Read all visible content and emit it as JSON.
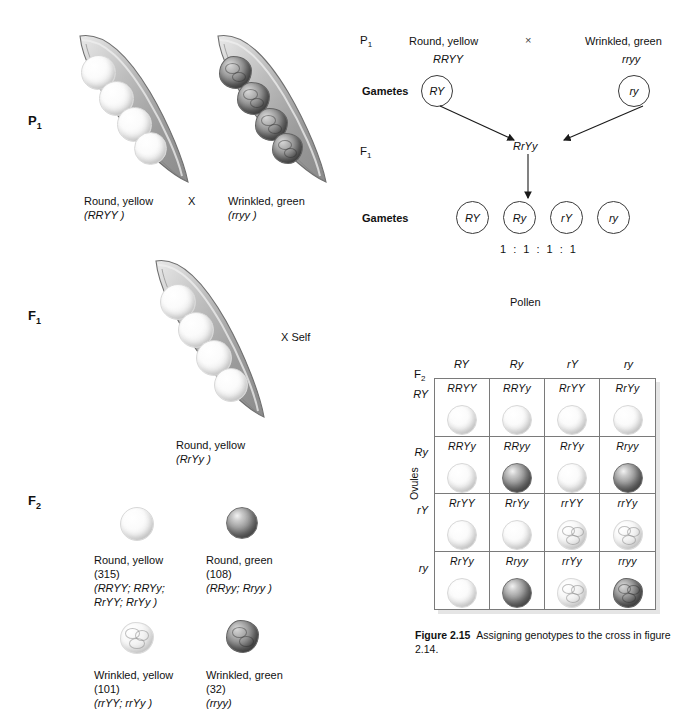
{
  "figure": {
    "number": "Figure 2.15",
    "caption": "Assigning genotypes to the cross in figure 2.14."
  },
  "left_panel": {
    "stages": {
      "p1": "P",
      "p1_sub": "1",
      "f1": "F",
      "f1_sub": "1",
      "f2": "F",
      "f2_sub": "2"
    },
    "p1": {
      "parent_left": {
        "phenotype": "Round, yellow",
        "genotype": "(RRYY )",
        "seed_type": "round-yellow"
      },
      "cross_symbol": "X",
      "parent_right": {
        "phenotype": "Wrinkled, green",
        "genotype": "(rryy )",
        "seed_type": "wrinkled-green"
      }
    },
    "f1": {
      "phenotype": "Round, yellow",
      "genotype": "(RrYy )",
      "self_label": "X Self"
    },
    "f2_classes": [
      {
        "seed_type": "round-yellow",
        "phenotype": "Round, yellow",
        "count": "(315)",
        "genotypes_line1": "(RRYY; RRYy;",
        "genotypes_line2": "RrYY; RrYy )"
      },
      {
        "seed_type": "round-green",
        "phenotype": "Round, green",
        "count": "(108)",
        "genotypes_line1": "(RRyy; Rryy )",
        "genotypes_line2": ""
      },
      {
        "seed_type": "wrinkled-yellow",
        "phenotype": "Wrinkled, yellow",
        "count": "(101)",
        "genotypes_line1": "(rrYY; rrYy )",
        "genotypes_line2": ""
      },
      {
        "seed_type": "wrinkled-green",
        "phenotype": "Wrinkled, green",
        "count": "(32)",
        "genotypes_line1": "(rryy)",
        "genotypes_line2": ""
      }
    ]
  },
  "right_panel": {
    "cross": {
      "p1_label": "P",
      "p1_sub": "1",
      "parent_left_pheno": "Round, yellow",
      "parent_left_geno": "RRYY",
      "cross_symbol": "×",
      "parent_right_pheno": "Wrinkled, green",
      "parent_right_geno": "rryy",
      "gametes_label_1": "Gametes",
      "gamete_left": "RY",
      "gamete_right": "ry",
      "f1_label": "F",
      "f1_sub": "1",
      "f1_genotype": "RrYy",
      "gametes_label_2": "Gametes",
      "f1_gametes": [
        "RY",
        "Ry",
        "rY",
        "ry"
      ],
      "ratio": "1 : 1 : 1 : 1"
    },
    "punnett": {
      "pollen_label": "Pollen",
      "ovules_label": "Ovules",
      "f2_label": "F",
      "f2_sub": "2",
      "columns": [
        "RY",
        "Ry",
        "rY",
        "ry"
      ],
      "rows": [
        "RY",
        "Ry",
        "rY",
        "ry"
      ],
      "cells": [
        {
          "genotype": "RRYY",
          "seed_type": "round-yellow"
        },
        {
          "genotype": "RRYy",
          "seed_type": "round-yellow"
        },
        {
          "genotype": "RrYY",
          "seed_type": "round-yellow"
        },
        {
          "genotype": "RrYy",
          "seed_type": "round-yellow"
        },
        {
          "genotype": "RRYy",
          "seed_type": "round-yellow"
        },
        {
          "genotype": "RRyy",
          "seed_type": "round-green"
        },
        {
          "genotype": "RrYy",
          "seed_type": "round-yellow"
        },
        {
          "genotype": "Rryy",
          "seed_type": "round-green"
        },
        {
          "genotype": "RrYY",
          "seed_type": "round-yellow"
        },
        {
          "genotype": "RrYy",
          "seed_type": "round-yellow"
        },
        {
          "genotype": "rrYY",
          "seed_type": "wrinkled-yellow"
        },
        {
          "genotype": "rrYy",
          "seed_type": "wrinkled-yellow"
        },
        {
          "genotype": "RrYy",
          "seed_type": "round-yellow"
        },
        {
          "genotype": "Rryy",
          "seed_type": "round-green"
        },
        {
          "genotype": "rrYy",
          "seed_type": "wrinkled-yellow"
        },
        {
          "genotype": "rryy",
          "seed_type": "wrinkled-green"
        }
      ]
    }
  },
  "colors": {
    "ink": "#111111",
    "grid_line": "#7a7a7a",
    "pod_outline": "#6a6a6a",
    "seed_pale": "#f2f2f2",
    "seed_dark": "#707070"
  }
}
